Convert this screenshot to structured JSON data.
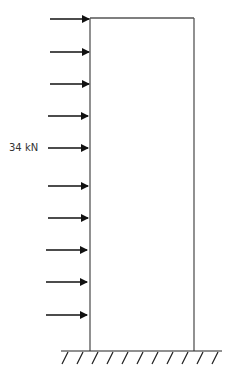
{
  "diagram": {
    "load_label": "34 kN",
    "load_count": 10,
    "load_direction": "right",
    "frame": {
      "left_x": 90,
      "right_x": 194,
      "top_y": 18,
      "base_y": 351
    },
    "load_y_positions": [
      19,
      52,
      84,
      116,
      148,
      186,
      218,
      250,
      282,
      315
    ],
    "support": "fixed-ground-hatched",
    "colors": {
      "line": "#111111",
      "frame": "#555555",
      "text": "#333333"
    }
  }
}
